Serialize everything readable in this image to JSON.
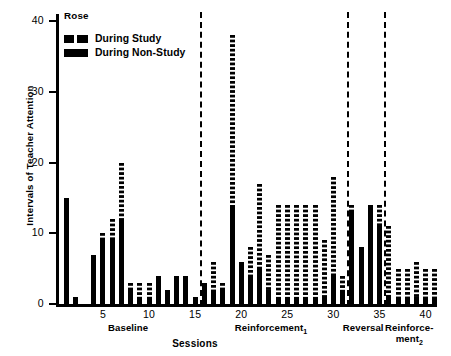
{
  "chart_data": {
    "type": "bar",
    "title": "Rose",
    "xlabel": "Sessions",
    "ylabel": "Intervals of Teacher Attention",
    "ylim": [
      0,
      41
    ],
    "yticks": [
      0,
      10,
      20,
      30,
      40
    ],
    "xticks": [
      5,
      10,
      15,
      20,
      25,
      30,
      35,
      40
    ],
    "xlim": [
      0.5,
      41.5
    ],
    "grid": false,
    "legend_position": "top-left",
    "legend": [
      {
        "name": "During Study",
        "pattern": "checkered"
      },
      {
        "name": "During Non-Study",
        "pattern": "solid"
      }
    ],
    "phases": [
      {
        "label": "Baseline",
        "start": 1,
        "end": 15
      },
      {
        "label": "Reinforcement₁",
        "start": 16,
        "end": 31
      },
      {
        "label": "Reversal",
        "start": 32,
        "end": 35
      },
      {
        "label": "Reinforce-\nment₂",
        "start": 36,
        "end": 41
      }
    ],
    "phase_dividers": [
      15.5,
      31.5,
      35.5
    ],
    "series": [
      {
        "name": "During Non-Study",
        "pattern": "solid"
      },
      {
        "name": "During Study",
        "pattern": "checkered"
      }
    ],
    "sessions": [
      1,
      2,
      3,
      4,
      5,
      6,
      7,
      8,
      9,
      10,
      11,
      12,
      13,
      14,
      15,
      16,
      17,
      18,
      19,
      20,
      21,
      22,
      23,
      24,
      25,
      26,
      27,
      28,
      29,
      30,
      31,
      32,
      33,
      34,
      35,
      36,
      37,
      38,
      39,
      40,
      41
    ],
    "non_study_values": [
      15,
      1,
      0,
      7,
      9,
      9,
      12,
      2,
      1,
      1,
      4,
      2,
      4,
      4,
      1,
      3,
      2,
      2,
      14,
      6,
      4,
      5,
      2,
      1,
      1,
      1,
      1,
      1,
      1,
      4,
      2,
      13,
      8,
      14,
      11,
      1,
      1,
      1,
      1,
      1,
      1
    ],
    "study_values": [
      0,
      0,
      0,
      0,
      1,
      3,
      8,
      1,
      2,
      2,
      0,
      0,
      0,
      0,
      0,
      0,
      4,
      1,
      24,
      0,
      4,
      12,
      5,
      13,
      13,
      13,
      13,
      13,
      8,
      14,
      2,
      1,
      0,
      0,
      3,
      10,
      4,
      4,
      5,
      4,
      4
    ],
    "totals": [
      15,
      1,
      0,
      7,
      10,
      12,
      20,
      3,
      3,
      3,
      4,
      2,
      4,
      4,
      1,
      3,
      6,
      3,
      38,
      6,
      8,
      17,
      7,
      14,
      14,
      14,
      14,
      14,
      9,
      18,
      4,
      14,
      8,
      14,
      14,
      11,
      5,
      5,
      6,
      5,
      5
    ]
  }
}
